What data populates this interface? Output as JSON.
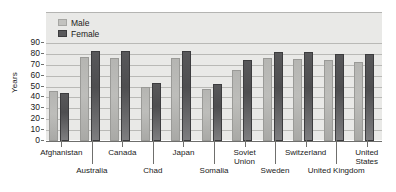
{
  "chart_data": {
    "type": "bar",
    "title": "",
    "xlabel": "",
    "ylabel": "Years",
    "ylim": [
      0,
      90
    ],
    "ytick_step": 10,
    "yticks": [
      90,
      80,
      70,
      60,
      50,
      40,
      30,
      20,
      10,
      0
    ],
    "grid": true,
    "legend_position": "top-left-inside",
    "categories": [
      "Afghanistan",
      "Australia",
      "Canada",
      "Chad",
      "Japan",
      "Somalia",
      "Soviet Union",
      "Sweden",
      "Switzerland",
      "United Kingdom",
      "United States"
    ],
    "series": [
      {
        "name": "Male",
        "color": "#bdbdba",
        "values": [
          46,
          77,
          76,
          50,
          76,
          48,
          65,
          76,
          75,
          74,
          73
        ]
      },
      {
        "name": "Female",
        "color": "#555557",
        "values": [
          44,
          83,
          83,
          53,
          83,
          52,
          74,
          82,
          82,
          80,
          80
        ]
      }
    ]
  },
  "axis": {
    "y_title": "Years"
  },
  "legend": {
    "items": [
      {
        "label": "Male"
      },
      {
        "label": "Female"
      }
    ]
  },
  "categories_layout": [
    {
      "label": "Afghanistan",
      "row": 1
    },
    {
      "label": "Australia",
      "row": 2
    },
    {
      "label": "Canada",
      "row": 1
    },
    {
      "label": "Chad",
      "row": 2
    },
    {
      "label": "Japan",
      "row": 1
    },
    {
      "label": "Somalia",
      "row": 2
    },
    {
      "label": "Soviet\nUnion",
      "row": 1
    },
    {
      "label": "Sweden",
      "row": 2
    },
    {
      "label": "Switzerland",
      "row": 1
    },
    {
      "label": "United Kingdom",
      "row": 2
    },
    {
      "label": "United\nStates",
      "row": 1
    }
  ],
  "colors": {
    "plot_background": "#e9e9e7",
    "gridline": "#b9b9b6",
    "axis": "#6f6f6d",
    "male_bar": "#bdbdba",
    "female_bar": "#555557",
    "text": "#1a1a1a"
  }
}
